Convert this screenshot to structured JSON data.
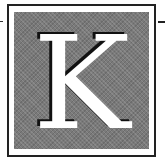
{
  "initial": {
    "letter": "K",
    "colors": {
      "panel": "#7a7a7a",
      "letter": "#ffffff",
      "shadow": "#111111",
      "border": "#222222"
    }
  }
}
